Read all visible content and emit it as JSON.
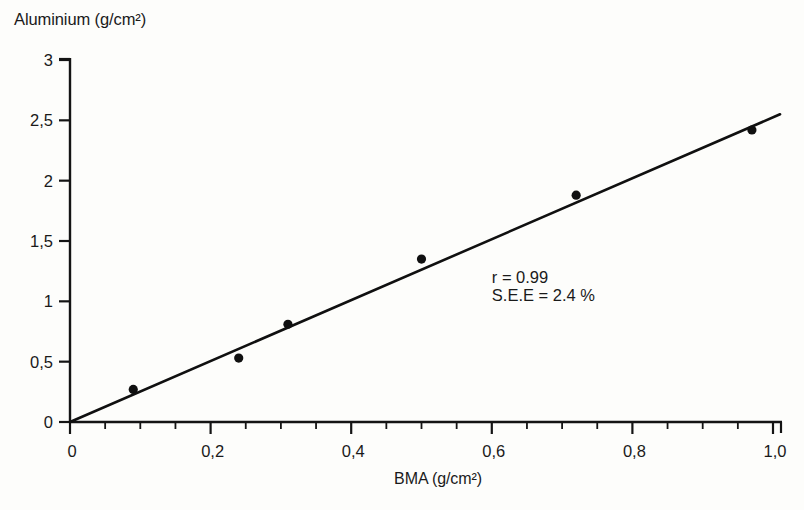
{
  "chart_data": {
    "type": "scatter",
    "title": "",
    "xlabel": "BMA (g/cm²)",
    "ylabel": "Aluminium (g/cm²)",
    "xlim": [
      0,
      1.01
    ],
    "ylim": [
      0,
      3
    ],
    "grid": false,
    "legend": null,
    "x_ticks": [
      "0",
      "0,2",
      "0,4",
      "0,6",
      "0,8",
      "1,0"
    ],
    "x_tick_values": [
      0,
      0.2,
      0.4,
      0.6,
      0.8,
      1.0
    ],
    "x_minor_tick_step": 0.05,
    "y_ticks": [
      "0",
      "0,5",
      "1",
      "1,5",
      "2",
      "2,5",
      "3"
    ],
    "y_tick_values": [
      0,
      0.5,
      1,
      1.5,
      2,
      2.5,
      3
    ],
    "series": [
      {
        "name": "measurements",
        "type": "scatter",
        "marker": "filled-circle",
        "color": "#101010",
        "x": [
          0.09,
          0.24,
          0.31,
          0.5,
          0.72,
          0.97
        ],
        "y": [
          0.27,
          0.53,
          0.81,
          1.35,
          1.88,
          2.42
        ]
      },
      {
        "name": "regression-line",
        "type": "line",
        "color": "#101010",
        "x": [
          0.0,
          1.01
        ],
        "y": [
          0.0,
          2.55
        ]
      }
    ],
    "annotations": [
      {
        "id": "correlation",
        "text": "r = 0.99",
        "x": 0.6,
        "y": 1.15
      },
      {
        "id": "standard-error",
        "text": "S.E.E = 2.4 %",
        "x": 0.6,
        "y": 1.0
      }
    ]
  },
  "axes": {
    "y_title": "Aluminium (g/cm²)",
    "x_title": "BMA (g/cm²)"
  },
  "annotation_block": {
    "line1": "r = 0.99",
    "line2": "S.E.E = 2.4 %"
  }
}
